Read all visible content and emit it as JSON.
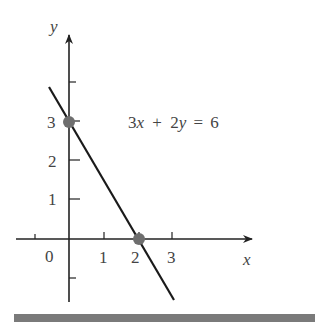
{
  "figure": {
    "equation": "3x + 2y = 6",
    "equation_parts": {
      "a": "3",
      "x": "x",
      "plus": "+",
      "b": "2",
      "y": "y",
      "eq": "=",
      "c": "6"
    },
    "x_axis_label": "x",
    "y_axis_label": "y",
    "origin_label": "0",
    "x_tick_labels": [
      "1",
      "2",
      "3"
    ],
    "y_tick_labels": [
      "1",
      "2",
      "3"
    ],
    "points": [
      {
        "label": "y-intercept",
        "x": 0,
        "y": 3
      },
      {
        "label": "x-intercept",
        "x": 2,
        "y": 0
      }
    ],
    "colors": {
      "axis": "#222222",
      "line": "#1a1a1a",
      "point": "#6e6e6e",
      "text": "#444444",
      "bar": "#7a7a7a"
    }
  }
}
